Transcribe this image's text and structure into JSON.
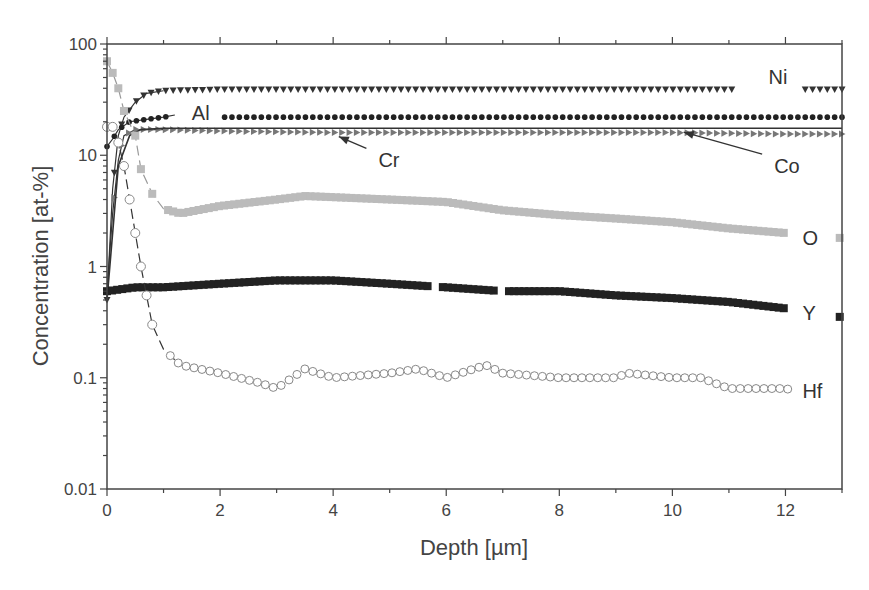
{
  "chart_data": {
    "type": "scatter",
    "title": "",
    "xlabel": "Depth [µm]",
    "ylabel": "Concentration [at-%]",
    "xlim": [
      0,
      13
    ],
    "ylim": [
      0.01,
      100
    ],
    "yscale": "log",
    "grid": false,
    "legend": "inline labels",
    "x_ticks": [
      0,
      2,
      4,
      6,
      8,
      10,
      12
    ],
    "x_tick_labels": [
      "0",
      "2",
      "4",
      "6",
      "8",
      "10",
      "12"
    ],
    "y_ticks": [
      0.01,
      0.1,
      1,
      10,
      100
    ],
    "y_tick_labels": [
      "0.01",
      "0.1",
      "1",
      "10",
      "100"
    ],
    "series": [
      {
        "name": "Ni",
        "marker": "triangle-down",
        "color": "#333333",
        "x": [
          0,
          0.1,
          0.2,
          0.3,
          0.5,
          0.7,
          1.0,
          2,
          4,
          6,
          8,
          10,
          11.5,
          12.3,
          13
        ],
        "y": [
          0.5,
          5,
          15,
          22,
          30,
          36,
          38,
          39,
          39,
          39,
          39,
          39,
          39,
          39,
          39
        ]
      },
      {
        "name": "Al",
        "marker": "circle-filled",
        "color": "#222222",
        "x": [
          0,
          0.1,
          0.2,
          0.4,
          0.7,
          1.0,
          1.2,
          2,
          4,
          6,
          8,
          10,
          12,
          13
        ],
        "y": [
          12,
          14,
          17,
          20,
          21,
          22,
          23,
          22,
          22,
          22,
          22,
          22,
          22,
          22
        ]
      },
      {
        "name": "Cr",
        "marker": "triangle-right",
        "color": "#777777",
        "x": [
          0,
          0.1,
          0.2,
          0.3,
          0.5,
          0.8,
          1.0,
          2,
          4,
          6,
          8,
          10,
          12,
          13
        ],
        "y": [
          0.6,
          3,
          9,
          15,
          17,
          17,
          17,
          16.5,
          16,
          16,
          16,
          16,
          15.5,
          15.5
        ]
      },
      {
        "name": "Co",
        "marker": "line",
        "color": "#333333",
        "x": [
          0,
          0.2,
          0.4,
          0.6,
          1.0,
          4,
          8,
          13
        ],
        "y": [
          0.5,
          8,
          15,
          17,
          17.5,
          17.5,
          17.5,
          17.5
        ]
      },
      {
        "name": "O",
        "marker": "square",
        "color": "#bbbbbb",
        "x": [
          0,
          0.1,
          0.2,
          0.3,
          0.5,
          0.6,
          0.8,
          1.0,
          1.3,
          2,
          3,
          3.5,
          4,
          5,
          6,
          7,
          8,
          9,
          10,
          11,
          12,
          13
        ],
        "y": [
          70,
          55,
          40,
          25,
          15,
          7.5,
          4.5,
          3.3,
          3.0,
          3.5,
          4.0,
          4.3,
          4.2,
          4.0,
          3.8,
          3.2,
          2.9,
          2.7,
          2.5,
          2.2,
          2.0,
          1.8
        ]
      },
      {
        "name": "Y",
        "marker": "square",
        "color": "#222222",
        "x": [
          0,
          0.5,
          1,
          2,
          3,
          4,
          5,
          6,
          7,
          8,
          9,
          10,
          11,
          12,
          13
        ],
        "y": [
          0.6,
          0.65,
          0.65,
          0.7,
          0.75,
          0.75,
          0.7,
          0.65,
          0.6,
          0.6,
          0.55,
          0.52,
          0.48,
          0.42,
          0.35
        ]
      },
      {
        "name": "Hf",
        "marker": "circle-open",
        "color": "#888888",
        "x": [
          0,
          0.1,
          0.2,
          0.3,
          0.4,
          0.5,
          0.6,
          0.7,
          0.8,
          1.0,
          1.3,
          2,
          2.7,
          3,
          3.5,
          4,
          5,
          5.5,
          6,
          6.7,
          7,
          8,
          9,
          9.2,
          10,
          10.5,
          11,
          12,
          13
        ],
        "y": [
          18,
          18,
          13,
          8,
          4,
          2,
          1.0,
          0.55,
          0.3,
          0.18,
          0.13,
          0.11,
          0.09,
          0.08,
          0.12,
          0.1,
          0.11,
          0.12,
          0.1,
          0.13,
          0.11,
          0.1,
          0.1,
          0.11,
          0.1,
          0.1,
          0.08,
          0.08,
          0.06
        ]
      }
    ],
    "annotations": [
      {
        "text": "Ni",
        "x": 11.7,
        "y": 50
      },
      {
        "text": "Al",
        "x": 1.5,
        "y": 24
      },
      {
        "text": "Cr",
        "x": 4.8,
        "y": 9,
        "arrow_to": [
          4.1,
          16
        ]
      },
      {
        "text": "Co",
        "x": 11.8,
        "y": 8,
        "arrow_to": [
          10.2,
          17.5
        ]
      },
      {
        "text": "O",
        "x": 12.3,
        "y": 1.8
      },
      {
        "text": "Y",
        "x": 12.3,
        "y": 0.38
      },
      {
        "text": "Hf",
        "x": 12.3,
        "y": 0.076
      }
    ]
  }
}
